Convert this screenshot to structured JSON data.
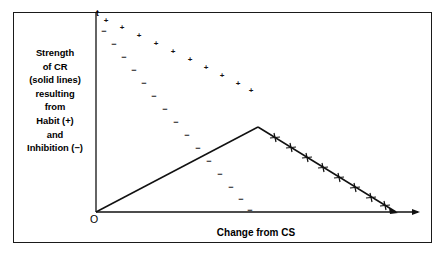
{
  "figure": {
    "caption_lines": [
      "Strength",
      "of CR",
      "(solid lines)",
      "resulting",
      "from",
      "Habit (+)",
      "and",
      "Inhibition (−)"
    ],
    "y_axis_label": "t",
    "x_axis_label": "Change from CS",
    "origin_label": "O",
    "plus_symbol": "+",
    "minus_symbol": "−",
    "line_color": "#111111",
    "frame_color": "#1a1a1a",
    "background_color": "#ffffff"
  },
  "chart_data": {
    "type": "line",
    "title": "",
    "xlabel": "Change from CS",
    "ylabel": "t",
    "grid": false,
    "legend": "none",
    "axis_origin_px": [
      96,
      212
    ],
    "axis_top_px": [
      96,
      12
    ],
    "axis_right_px": [
      420,
      212
    ],
    "series": [
      {
        "name": "Strength of CR (solid line)",
        "style": "solid",
        "marker": "plus-ticks-on-descending-limb",
        "points_px": [
          [
            96,
            212
          ],
          [
            258,
            127
          ],
          [
            396,
            212
          ]
        ]
      },
      {
        "name": "Habit (+)",
        "style": "dotted-plus",
        "marker": "+",
        "points_px": [
          [
            106,
            21
          ],
          [
            122,
            28
          ],
          [
            139,
            36
          ],
          [
            156,
            44
          ],
          [
            173,
            52
          ],
          [
            190,
            60
          ],
          [
            206,
            68
          ],
          [
            222,
            76
          ],
          [
            238,
            84
          ],
          [
            251,
            91
          ]
        ]
      },
      {
        "name": "Inhibition (−)",
        "style": "dotted-minus",
        "marker": "−",
        "points_px": [
          [
            104,
            31
          ],
          [
            114,
            44
          ],
          [
            124,
            57
          ],
          [
            134,
            70
          ],
          [
            144,
            83
          ],
          [
            154,
            96
          ],
          [
            165,
            109
          ],
          [
            176,
            122
          ],
          [
            187,
            135
          ],
          [
            198,
            148
          ],
          [
            209,
            161
          ],
          [
            220,
            174
          ],
          [
            231,
            187
          ],
          [
            241,
            199
          ],
          [
            250,
            210
          ]
        ]
      }
    ]
  }
}
